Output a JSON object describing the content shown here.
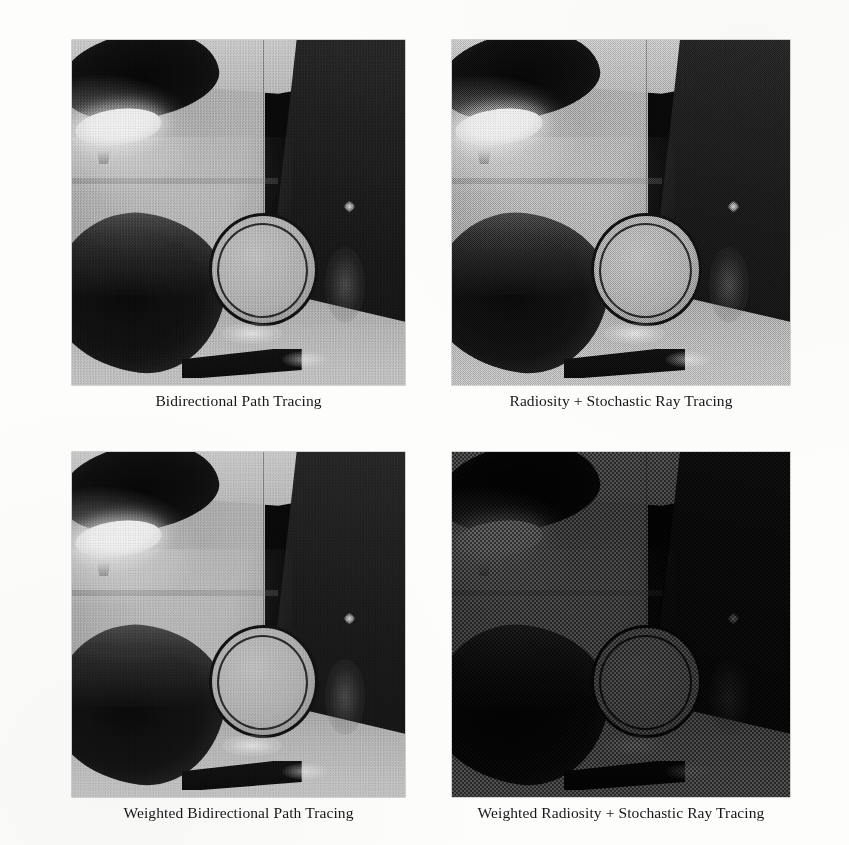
{
  "figure": {
    "type": "image-grid",
    "rows": 2,
    "columns": 2,
    "background_color": "#fdfdfb",
    "caption_color": "#17171a",
    "panels": [
      {
        "id": "panel-bidirectional-path-tracing",
        "caption": "Bidirectional Path Tracing",
        "position": "top-left",
        "scene": "room interior with wall lamp, glass ring and dark box",
        "noise_level": "moderate",
        "exposure": "bright"
      },
      {
        "id": "panel-radiosity-stochastic-ray-tracing",
        "caption": "Radiosity + Stochastic Ray Tracing",
        "position": "top-right",
        "scene": "room interior with wall lamp, glass ring and dark box",
        "noise_level": "high",
        "exposure": "bright"
      },
      {
        "id": "panel-weighted-bidirectional-path-tracing",
        "caption": "Weighted Bidirectional Path Tracing",
        "position": "bottom-left",
        "scene": "room interior with wall lamp, glass ring and dark box",
        "noise_level": "low",
        "exposure": "bright"
      },
      {
        "id": "panel-weighted-radiosity-stochastic-ray-tracing",
        "caption": "Weighted Radiosity + Stochastic Ray Tracing",
        "position": "bottom-right",
        "scene": "room interior with wall lamp, glass ring and dark box",
        "noise_level": "very-high",
        "exposure": "dark"
      }
    ]
  }
}
